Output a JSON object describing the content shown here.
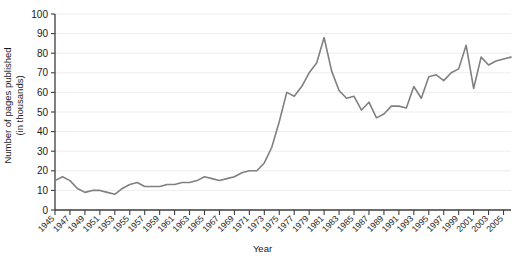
{
  "chart_data": {
    "type": "line",
    "title": "",
    "xlabel": "Year",
    "ylabel": "Number of pages published\n(in thousands)",
    "ylabel_line1": "Number of pages published",
    "ylabel_line2": "(in thousands)",
    "xlim": [
      1945,
      2006
    ],
    "ylim": [
      0,
      100
    ],
    "yticks": [
      0,
      10,
      20,
      30,
      40,
      50,
      60,
      70,
      80,
      90,
      100
    ],
    "ytick_labels": [
      "0",
      "10",
      "20",
      "30",
      "40",
      "50",
      "60",
      "70",
      "80",
      "90",
      "100"
    ],
    "xticks": [
      1945,
      1947,
      1949,
      1951,
      1953,
      1955,
      1957,
      1959,
      1961,
      1963,
      1965,
      1967,
      1969,
      1971,
      1973,
      1975,
      1977,
      1979,
      1981,
      1983,
      1985,
      1987,
      1989,
      1991,
      1993,
      1995,
      1997,
      1999,
      2001,
      2003,
      2005
    ],
    "xtick_labels": [
      "1945",
      "1947",
      "1949",
      "1951",
      "1953",
      "1955",
      "1957",
      "1959",
      "1961",
      "1963",
      "1965",
      "1967",
      "1969",
      "1971",
      "1973",
      "1975",
      "1977",
      "1979",
      "1981",
      "1983",
      "1985",
      "1987",
      "1989",
      "1991",
      "1993",
      "1995",
      "1997",
      "1999",
      "2001",
      "2003",
      "2005"
    ],
    "grid": true,
    "grid_axis": "y",
    "legend": "none",
    "line_color": "#808080",
    "line_width": 1.6,
    "x": [
      1945,
      1946,
      1947,
      1948,
      1949,
      1950,
      1951,
      1952,
      1953,
      1954,
      1955,
      1956,
      1957,
      1958,
      1959,
      1960,
      1961,
      1962,
      1963,
      1964,
      1965,
      1966,
      1967,
      1968,
      1969,
      1970,
      1971,
      1972,
      1973,
      1974,
      1975,
      1976,
      1977,
      1978,
      1979,
      1980,
      1981,
      1982,
      1983,
      1984,
      1985,
      1986,
      1987,
      1988,
      1989,
      1990,
      1991,
      1992,
      1993,
      1994,
      1995,
      1996,
      1997,
      1998,
      1999,
      2000,
      2001,
      2002,
      2003,
      2004,
      2005,
      2006
    ],
    "values": [
      15,
      17,
      15,
      11,
      9,
      10,
      10,
      9,
      8,
      11,
      13,
      14,
      12,
      12,
      12,
      13,
      13,
      14,
      14,
      15,
      17,
      16,
      15,
      16,
      17,
      19,
      20,
      20,
      24,
      32,
      45,
      60,
      58,
      63,
      70,
      75,
      88,
      71,
      61,
      57,
      58,
      51,
      55,
      47,
      49,
      53,
      53,
      52,
      63,
      57,
      68,
      69,
      66,
      70,
      72,
      84,
      62,
      78,
      74,
      76,
      77,
      78
    ]
  }
}
